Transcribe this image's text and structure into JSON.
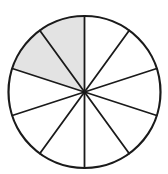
{
  "figure": {
    "title": "Fraction circle divided into ten equal sectors with two sectors shaded",
    "shape": "circle",
    "center_x": 84.5,
    "center_y": 92,
    "radius": 76,
    "total_sectors": 10,
    "shaded_sectors": 2,
    "unshaded_sectors": 8,
    "sector_angle_degrees": 36,
    "fraction_shaded": "2/10",
    "start_angle_degrees": 90,
    "shading_direction": "counter-clockwise",
    "colors": {
      "shaded_fill": "#e3e3e3",
      "unshaded_fill": "#ffffff",
      "stroke": "#1a1a1a",
      "background": "#ffffff"
    },
    "outline_stroke_width": 2.2,
    "spoke_stroke_width": 1.8
  },
  "chart_data": {
    "type": "pie",
    "categories": [
      "sector-1",
      "sector-2",
      "sector-3",
      "sector-4",
      "sector-5",
      "sector-6",
      "sector-7",
      "sector-8",
      "sector-9",
      "sector-10"
    ],
    "values": [
      10,
      10,
      10,
      10,
      10,
      10,
      10,
      10,
      10,
      10
    ],
    "slice_angles_degrees": [
      36,
      36,
      36,
      36,
      36,
      36,
      36,
      36,
      36,
      36
    ],
    "slice_start_angles_degrees": [
      90,
      126,
      162,
      198,
      234,
      270,
      306,
      342,
      18,
      54
    ],
    "slice_states": [
      "shaded",
      "shaded",
      "unshaded",
      "unshaded",
      "unshaded",
      "unshaded",
      "unshaded",
      "unshaded",
      "unshaded",
      "unshaded"
    ],
    "legend": [],
    "xlabel": "",
    "ylabel": "",
    "grid": false,
    "legend_position": "none"
  }
}
